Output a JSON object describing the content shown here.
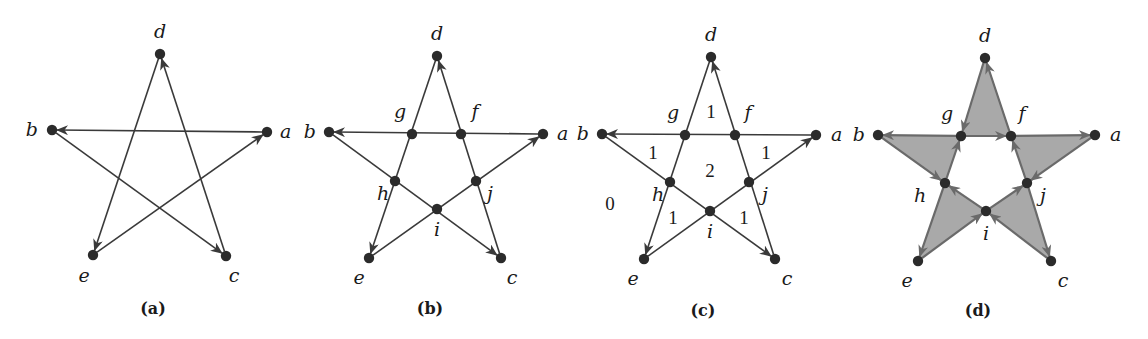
{
  "figure": {
    "panels": [
      {
        "id": "a",
        "caption": "(a)",
        "nodes": [
          {
            "name": "d",
            "x": 160,
            "y": 54,
            "lx": 160,
            "ly": 38,
            "anchor": "middle"
          },
          {
            "name": "b",
            "x": 52,
            "y": 130,
            "lx": 38,
            "ly": 136,
            "anchor": "end"
          },
          {
            "name": "a",
            "x": 267,
            "y": 132,
            "lx": 280,
            "ly": 138,
            "anchor": "start"
          },
          {
            "name": "e",
            "x": 93,
            "y": 255,
            "lx": 84,
            "ly": 282,
            "anchor": "middle"
          },
          {
            "name": "c",
            "x": 226,
            "y": 256,
            "lx": 234,
            "ly": 282,
            "anchor": "middle"
          }
        ],
        "edges": [
          [
            "a",
            "b"
          ],
          [
            "b",
            "c"
          ],
          [
            "c",
            "d"
          ],
          [
            "d",
            "e"
          ],
          [
            "e",
            "a"
          ]
        ],
        "caption_pos": {
          "x": 153,
          "y": 314
        }
      },
      {
        "id": "b",
        "caption": "(b)",
        "nodes": [
          {
            "name": "d",
            "x": 437,
            "y": 56,
            "lx": 437,
            "ly": 40,
            "anchor": "middle"
          },
          {
            "name": "b",
            "x": 329,
            "y": 132,
            "lx": 316,
            "ly": 138,
            "anchor": "end"
          },
          {
            "name": "a",
            "x": 543,
            "y": 134,
            "lx": 557,
            "ly": 140,
            "anchor": "start"
          },
          {
            "name": "g",
            "x": 412,
            "y": 134,
            "lx": 400,
            "ly": 118,
            "anchor": "middle"
          },
          {
            "name": "f",
            "x": 461,
            "y": 134,
            "lx": 475,
            "ly": 118,
            "anchor": "middle"
          },
          {
            "name": "h",
            "x": 395,
            "y": 181,
            "lx": 383,
            "ly": 200,
            "anchor": "middle"
          },
          {
            "name": "j",
            "x": 476,
            "y": 181,
            "lx": 490,
            "ly": 200,
            "anchor": "middle"
          },
          {
            "name": "i",
            "x": 437,
            "y": 209,
            "lx": 437,
            "ly": 236,
            "anchor": "middle"
          },
          {
            "name": "e",
            "x": 369,
            "y": 258,
            "lx": 359,
            "ly": 284,
            "anchor": "middle"
          },
          {
            "name": "c",
            "x": 501,
            "y": 258,
            "lx": 512,
            "ly": 284,
            "anchor": "middle"
          }
        ],
        "edges": [
          [
            "a",
            "b"
          ],
          [
            "b",
            "c"
          ],
          [
            "c",
            "d"
          ],
          [
            "d",
            "e"
          ],
          [
            "e",
            "a"
          ]
        ],
        "caption_pos": {
          "x": 430,
          "y": 314
        }
      },
      {
        "id": "c",
        "caption": "(c)",
        "nodes": [
          {
            "name": "d",
            "x": 711,
            "y": 57,
            "lx": 711,
            "ly": 41,
            "anchor": "middle"
          },
          {
            "name": "b",
            "x": 602,
            "y": 134,
            "lx": 589,
            "ly": 140,
            "anchor": "end"
          },
          {
            "name": "a",
            "x": 816,
            "y": 135,
            "lx": 831,
            "ly": 141,
            "anchor": "start"
          },
          {
            "name": "g",
            "x": 685,
            "y": 135,
            "lx": 673,
            "ly": 119,
            "anchor": "middle"
          },
          {
            "name": "f",
            "x": 735,
            "y": 135,
            "lx": 748,
            "ly": 119,
            "anchor": "middle"
          },
          {
            "name": "h",
            "x": 670,
            "y": 182,
            "lx": 658,
            "ly": 201,
            "anchor": "middle"
          },
          {
            "name": "j",
            "x": 749,
            "y": 182,
            "lx": 765,
            "ly": 201,
            "anchor": "middle"
          },
          {
            "name": "i",
            "x": 710,
            "y": 211,
            "lx": 710,
            "ly": 238,
            "anchor": "middle"
          },
          {
            "name": "e",
            "x": 644,
            "y": 259,
            "lx": 633,
            "ly": 285,
            "anchor": "middle"
          },
          {
            "name": "c",
            "x": 775,
            "y": 259,
            "lx": 787,
            "ly": 285,
            "anchor": "middle"
          }
        ],
        "edges": [
          [
            "a",
            "b"
          ],
          [
            "b",
            "c"
          ],
          [
            "c",
            "d"
          ],
          [
            "d",
            "e"
          ],
          [
            "e",
            "a"
          ]
        ],
        "region_labels": [
          {
            "text": "1",
            "x": 711,
            "y": 118
          },
          {
            "text": "1",
            "x": 653,
            "y": 159
          },
          {
            "text": "1",
            "x": 766,
            "y": 159
          },
          {
            "text": "2",
            "x": 710,
            "y": 177
          },
          {
            "text": "0",
            "x": 610,
            "y": 210
          },
          {
            "text": "1",
            "x": 673,
            "y": 224
          },
          {
            "text": "1",
            "x": 744,
            "y": 224
          }
        ],
        "caption_pos": {
          "x": 703,
          "y": 316
        }
      },
      {
        "id": "d",
        "caption": "(d)",
        "nodes": [
          {
            "name": "d",
            "x": 985,
            "y": 58,
            "lx": 985,
            "ly": 42,
            "anchor": "middle"
          },
          {
            "name": "b",
            "x": 878,
            "y": 135,
            "lx": 865,
            "ly": 141,
            "anchor": "end"
          },
          {
            "name": "a",
            "x": 1095,
            "y": 135,
            "lx": 1110,
            "ly": 141,
            "anchor": "start"
          },
          {
            "name": "g",
            "x": 961,
            "y": 136,
            "lx": 947,
            "ly": 120,
            "anchor": "middle"
          },
          {
            "name": "f",
            "x": 1011,
            "y": 136,
            "lx": 1022,
            "ly": 120,
            "anchor": "middle"
          },
          {
            "name": "h",
            "x": 945,
            "y": 183,
            "lx": 920,
            "ly": 202,
            "anchor": "middle"
          },
          {
            "name": "j",
            "x": 1027,
            "y": 183,
            "lx": 1043,
            "ly": 202,
            "anchor": "middle"
          },
          {
            "name": "i",
            "x": 986,
            "y": 211,
            "lx": 986,
            "ly": 240,
            "anchor": "middle"
          },
          {
            "name": "e",
            "x": 918,
            "y": 261,
            "lx": 907,
            "ly": 287,
            "anchor": "middle"
          },
          {
            "name": "c",
            "x": 1051,
            "y": 261,
            "lx": 1063,
            "ly": 287,
            "anchor": "middle"
          }
        ],
        "triangles": [
          {
            "vertices": [
              "d",
              "g",
              "f"
            ],
            "cycle": [
              [
                "d",
                "g"
              ],
              [
                "g",
                "f"
              ],
              [
                "f",
                "d"
              ]
            ]
          },
          {
            "vertices": [
              "g",
              "b",
              "h"
            ],
            "cycle": [
              [
                "g",
                "b"
              ],
              [
                "b",
                "h"
              ],
              [
                "h",
                "g"
              ]
            ]
          },
          {
            "vertices": [
              "f",
              "a",
              "j"
            ],
            "cycle": [
              [
                "f",
                "a"
              ],
              [
                "a",
                "j"
              ],
              [
                "j",
                "f"
              ]
            ]
          },
          {
            "vertices": [
              "h",
              "e",
              "i"
            ],
            "cycle": [
              [
                "h",
                "e"
              ],
              [
                "e",
                "i"
              ],
              [
                "i",
                "h"
              ]
            ]
          },
          {
            "vertices": [
              "i",
              "j",
              "c"
            ],
            "cycle": [
              [
                "i",
                "j"
              ],
              [
                "j",
                "c"
              ],
              [
                "c",
                "i"
              ]
            ]
          }
        ],
        "caption_pos": {
          "x": 978,
          "y": 316
        }
      }
    ],
    "colors": {
      "node": "#2b2b2b",
      "edge": "#3a3a3a",
      "shaded_edge": "#6a6a6a",
      "shade_fill": "#a9a9a9"
    }
  }
}
